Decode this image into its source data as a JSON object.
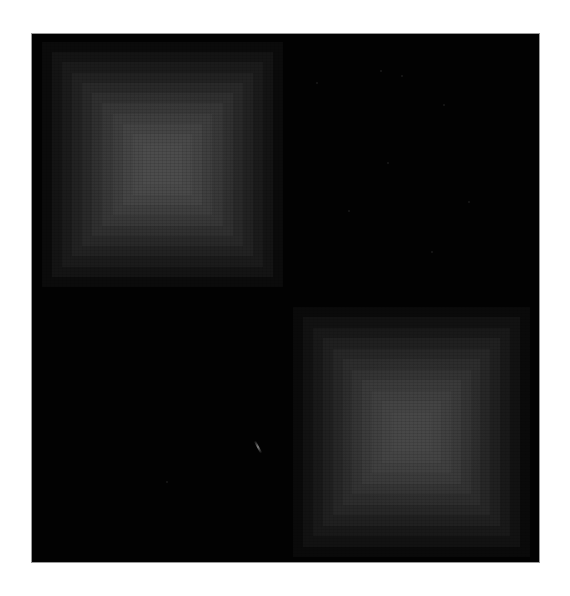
{
  "artwork": {
    "background_color": "#ffffff",
    "canvas": {
      "x": 31,
      "y": 33,
      "width": 509,
      "height": 530,
      "color": "#030303"
    },
    "squares": [
      {
        "name": "top-left-gradient-square",
        "x": 42,
        "y": 42,
        "width": 241,
        "height": 245,
        "center_color": "#4b4b4b",
        "edge_color": "#0a0a0a",
        "steps": [
          "#0b0b0b",
          "#141414",
          "#1b1b1b",
          "#222222",
          "#292929",
          "#303030",
          "#373737",
          "#3d3d3d",
          "#434343",
          "#484848",
          "#4b4b4b"
        ]
      },
      {
        "name": "bottom-right-gradient-square",
        "x": 293,
        "y": 307,
        "width": 237,
        "height": 250,
        "center_color": "#454545",
        "edge_color": "#090909",
        "steps": [
          "#0a0a0a",
          "#121212",
          "#191919",
          "#202020",
          "#272727",
          "#2d2d2d",
          "#333333",
          "#393939",
          "#3e3e3e",
          "#424242",
          "#454545"
        ]
      }
    ],
    "artifacts": {
      "streak": {
        "x": 257,
        "y": 440
      },
      "specks": [
        {
          "x": 316,
          "y": 82
        },
        {
          "x": 380,
          "y": 70
        },
        {
          "x": 401,
          "y": 75
        },
        {
          "x": 443,
          "y": 104
        },
        {
          "x": 387,
          "y": 162
        },
        {
          "x": 348,
          "y": 210
        },
        {
          "x": 468,
          "y": 201
        },
        {
          "x": 431,
          "y": 251
        },
        {
          "x": 166,
          "y": 481
        }
      ]
    }
  }
}
